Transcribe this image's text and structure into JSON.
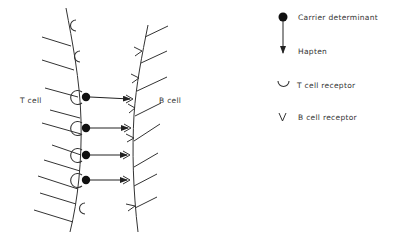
{
  "diagram": {
    "labels": {
      "t_cell": "T cell",
      "b_cell": "B cell"
    },
    "legend": [
      {
        "icon": "carrier-determinant-dot-icon",
        "label": "Carrier determinant"
      },
      {
        "icon": "hapten-arrow-icon",
        "label": "Hapten"
      },
      {
        "icon": "t-cell-receptor-cup-icon",
        "label": "T cell receptor"
      },
      {
        "icon": "b-cell-receptor-v-icon",
        "glyph": "V",
        "label": "B cell receptor"
      }
    ],
    "carrier_hapten_bridges": 4,
    "free_t_cell_receptors": 3,
    "free_b_cell_receptors": 4,
    "colors": {
      "ink": "#222222",
      "background": "#ffffff"
    }
  }
}
